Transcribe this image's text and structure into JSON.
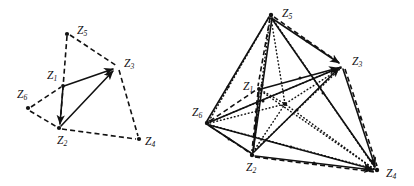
{
  "figure": {
    "title": "",
    "background_color": "#ffffff",
    "ink_color": "#111111",
    "panels": [
      {
        "id": "left-panel",
        "name": "triangle-with-outer-points",
        "labels": [
          {
            "id": "z1",
            "text": "Z",
            "sub": "1",
            "x": 47,
            "y": 76
          },
          {
            "id": "z2",
            "text": "Z",
            "sub": "2",
            "x": 57,
            "y": 141
          },
          {
            "id": "z3",
            "text": "Z",
            "sub": "3",
            "x": 124,
            "y": 64
          },
          {
            "id": "z4",
            "text": "Z",
            "sub": "4",
            "x": 145,
            "y": 142
          },
          {
            "id": "z5",
            "text": "Z",
            "sub": "5",
            "x": 77,
            "y": 31
          },
          {
            "id": "z6",
            "text": "Z",
            "sub": "6",
            "x": 17,
            "y": 95
          }
        ],
        "vertices": [
          {
            "id": "z1",
            "x": 63,
            "y": 86
          },
          {
            "id": "z2",
            "x": 59,
            "y": 128
          },
          {
            "id": "z3",
            "x": 118,
            "y": 67
          },
          {
            "id": "z4",
            "x": 139,
            "y": 139
          },
          {
            "id": "z5",
            "x": 67,
            "y": 34
          },
          {
            "id": "z6",
            "x": 28,
            "y": 108
          }
        ]
      },
      {
        "id": "right-panel",
        "name": "tetrahedral-network",
        "labels": [
          {
            "id": "z1",
            "text": "Z",
            "sub": "1",
            "x": 243,
            "y": 87
          },
          {
            "id": "z2",
            "text": "Z",
            "sub": "2",
            "x": 246,
            "y": 168
          },
          {
            "id": "z3",
            "text": "Z",
            "sub": "3",
            "x": 352,
            "y": 62
          },
          {
            "id": "z4",
            "text": "Z",
            "sub": "4",
            "x": 386,
            "y": 174
          },
          {
            "id": "z5",
            "text": "Z",
            "sub": "5",
            "x": 282,
            "y": 14
          },
          {
            "id": "z6",
            "text": "Z",
            "sub": "6",
            "x": 192,
            "y": 113
          }
        ],
        "vertices": [
          {
            "id": "z1",
            "x": 259,
            "y": 89
          },
          {
            "id": "z2",
            "x": 252,
            "y": 155
          },
          {
            "id": "z3",
            "x": 343,
            "y": 66
          },
          {
            "id": "z4",
            "x": 377,
            "y": 170
          },
          {
            "id": "z5",
            "x": 271,
            "y": 15
          },
          {
            "id": "z6",
            "x": 207,
            "y": 123
          },
          {
            "id": "centroid",
            "x": 285,
            "y": 104
          }
        ]
      }
    ],
    "legend": {
      "solid_meaning": "directed solid edge",
      "dashed_meaning": "dashed edge",
      "dotted_meaning": "dotted edge"
    }
  }
}
